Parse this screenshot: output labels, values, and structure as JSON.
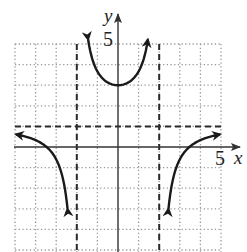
{
  "chart_data": {
    "type": "line",
    "title": "",
    "xlabel": "x",
    "ylabel": "y",
    "xlim": [
      -5,
      5
    ],
    "ylim": [
      -5,
      5
    ],
    "grid": true,
    "grid_style": "dotted",
    "tick_labels": {
      "x": "5",
      "y": "5"
    },
    "asymptotes": {
      "vertical": [
        -2,
        2
      ],
      "horizontal": [
        1
      ]
    },
    "series": [
      {
        "name": "left-branch",
        "description": "approaches y=1 from below as x->-inf, falls to -inf as x->-2 from left",
        "points": [
          [
            -5,
            0.55
          ],
          [
            -4,
            0.3
          ],
          [
            -3,
            -0.6
          ],
          [
            -2.5,
            -2.6
          ],
          [
            -2.3,
            -5
          ]
        ]
      },
      {
        "name": "middle-branch",
        "description": "U-shaped, minimum at (0,3), rises to +inf near x=-2 and x=2",
        "points": [
          [
            -1.5,
            5
          ],
          [
            -1,
            3.7
          ],
          [
            0,
            3
          ],
          [
            1,
            3.7
          ],
          [
            1.5,
            5
          ]
        ]
      },
      {
        "name": "right-branch",
        "description": "rises from -inf near x=2, crosses x-axis near x=3, approaches y=1 from below",
        "points": [
          [
            2.3,
            -5
          ],
          [
            2.5,
            -2.6
          ],
          [
            3,
            -0.6
          ],
          [
            4,
            0.3
          ],
          [
            5,
            0.55
          ]
        ]
      }
    ]
  },
  "labels": {
    "x_axis": "x",
    "y_axis": "y",
    "x_tick": "5",
    "y_tick": "5"
  },
  "colors": {
    "curve": "#1a1a1a",
    "axis": "#333333",
    "grid": "#9a9a9a",
    "asymptote": "#2a2a2a"
  }
}
